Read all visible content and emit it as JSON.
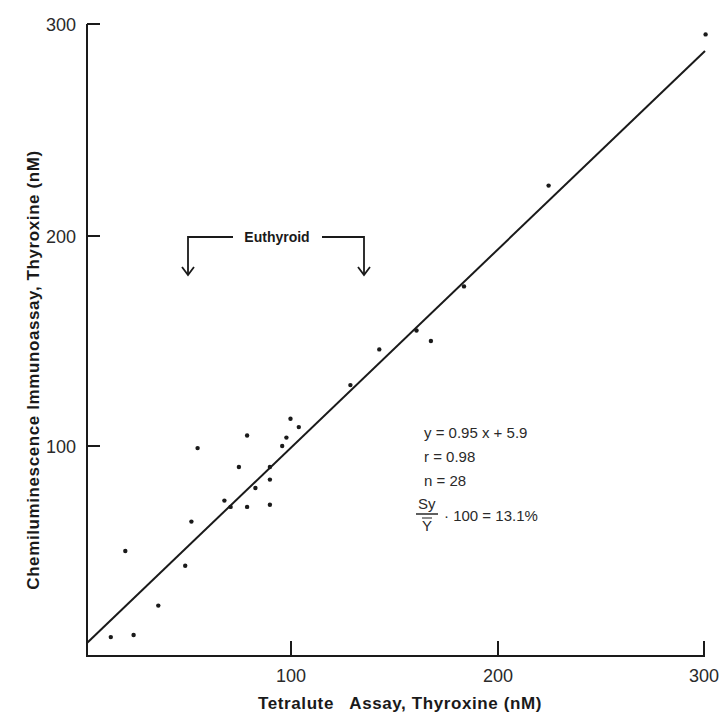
{
  "chart_data": {
    "type": "scatter",
    "title": "",
    "xlabel": "Tetralute   Assay, Thyroxine (nM)",
    "ylabel": "Chemiluminescence Immunoassay, Thyroxine (nM)",
    "xlim": [
      0,
      300
    ],
    "ylim": [
      0,
      300
    ],
    "x_ticks": [
      100,
      200,
      300
    ],
    "y_ticks": [
      100,
      200,
      300
    ],
    "x_tick_labels": [
      "100",
      "200",
      "300"
    ],
    "y_tick_labels": [
      "100",
      "200",
      "300"
    ],
    "grid": false,
    "legend": null,
    "series": [
      {
        "name": "samples",
        "points": [
          [
            13,
            9
          ],
          [
            24,
            10
          ],
          [
            20,
            50
          ],
          [
            36,
            24
          ],
          [
            49,
            43
          ],
          [
            52,
            64
          ],
          [
            55,
            99
          ],
          [
            68,
            74
          ],
          [
            71,
            71
          ],
          [
            75,
            90
          ],
          [
            79,
            105
          ],
          [
            79,
            71
          ],
          [
            83,
            80
          ],
          [
            90,
            84
          ],
          [
            90,
            72
          ],
          [
            90,
            90
          ],
          [
            96,
            100
          ],
          [
            98,
            104
          ],
          [
            100,
            113
          ],
          [
            104,
            109
          ],
          [
            129,
            129
          ],
          [
            143,
            146
          ],
          [
            161,
            155
          ],
          [
            168,
            150
          ],
          [
            184,
            176
          ],
          [
            225,
            224
          ],
          [
            301,
            296
          ]
        ]
      }
    ],
    "regression_line": {
      "slope": 0.95,
      "intercept": 5.9,
      "x_range": [
        0,
        300
      ]
    },
    "annotations": {
      "euthyroid_label": "Euthyroid",
      "euthyroid_range_x": [
        50,
        135
      ],
      "stats": {
        "equation": "y = 0.95 x + 5.9",
        "r": "r = 0.98",
        "n": "n = 28",
        "cv_numerator": "Sy",
        "cv_denominator": "Y",
        "cv_rest": "· 100 = 13.1%"
      }
    }
  }
}
